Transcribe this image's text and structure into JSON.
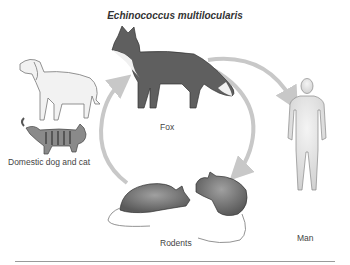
{
  "diagram": {
    "title": "Echinococcus multilocularis",
    "nodes": [
      {
        "id": "dog_cat",
        "label": "Domestic dog and cat"
      },
      {
        "id": "fox",
        "label": "Fox"
      },
      {
        "id": "rodents",
        "label": "Rodents"
      },
      {
        "id": "man",
        "label": "Man"
      }
    ],
    "edges": [
      {
        "from": "fox",
        "to": "man"
      },
      {
        "from": "fox",
        "to": "rodents"
      },
      {
        "from": "rodents",
        "to": "fox"
      }
    ],
    "colors": {
      "arrow": "#c8c8c8",
      "fox": "#5f5f5f",
      "rodent": "#6e6e6e",
      "human": "#e4e4e4",
      "outline": "#555555",
      "rule": "#9a9a9a"
    }
  }
}
